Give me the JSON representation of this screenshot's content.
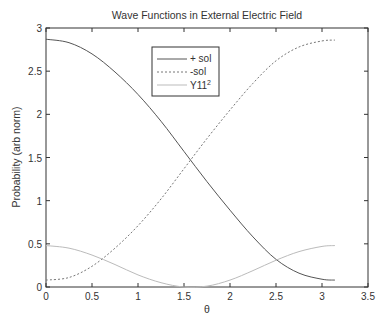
{
  "chart_data": {
    "type": "line",
    "title": "Wave Functions in External Electric Field",
    "xlabel": "θ",
    "ylabel": "Probability (arb norm)",
    "xlim": [
      0,
      3.5
    ],
    "ylim": [
      0,
      3
    ],
    "xticks": [
      "0",
      "0.5",
      "1",
      "1.5",
      "2",
      "2.5",
      "3",
      "3.5"
    ],
    "yticks": [
      "0",
      "0.5",
      "1",
      "1.5",
      "2",
      "2.5",
      "3"
    ],
    "grid": false,
    "legend_position": "upper-left-center",
    "x": [
      0,
      0.25,
      0.5,
      0.75,
      1.0,
      1.25,
      1.5,
      1.75,
      2.0,
      2.25,
      2.5,
      2.75,
      3.0,
      3.14
    ],
    "series": [
      {
        "name": "+ sol",
        "style": "solid",
        "color": "#555555",
        "values": [
          2.87,
          2.83,
          2.7,
          2.49,
          2.23,
          1.92,
          1.57,
          1.22,
          0.89,
          0.58,
          0.32,
          0.16,
          0.09,
          0.08
        ]
      },
      {
        "name": "-sol",
        "style": "dashed",
        "color": "#777777",
        "values": [
          0.08,
          0.11,
          0.24,
          0.45,
          0.71,
          1.02,
          1.37,
          1.72,
          2.05,
          2.36,
          2.62,
          2.78,
          2.85,
          2.86
        ]
      },
      {
        "name": "Y11²",
        "style": "solid",
        "color": "#bbbbbb",
        "values": [
          0.48,
          0.45,
          0.37,
          0.26,
          0.14,
          0.05,
          0.0,
          0.01,
          0.08,
          0.19,
          0.31,
          0.41,
          0.47,
          0.48
        ]
      }
    ]
  },
  "legend": {
    "items": [
      {
        "label": "+ sol",
        "sup": ""
      },
      {
        "label": "-sol",
        "sup": ""
      },
      {
        "label": "Y11",
        "sup": "2"
      }
    ]
  }
}
